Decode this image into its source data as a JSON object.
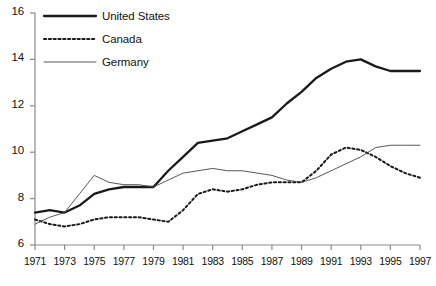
{
  "chart_data": {
    "type": "line",
    "title": "",
    "xlabel": "",
    "ylabel": "",
    "xlim": [
      1971,
      1997
    ],
    "ylim": [
      6,
      16
    ],
    "yticks": [
      6,
      8,
      10,
      12,
      14,
      16
    ],
    "ytick_labels": [
      "6",
      "8",
      "10",
      "12",
      "14",
      "16"
    ],
    "xticks": [
      1971,
      1973,
      1975,
      1977,
      1979,
      1981,
      1983,
      1985,
      1987,
      1989,
      1991,
      1993,
      1995,
      1997
    ],
    "xtick_labels": [
      "1971",
      "1973",
      "1975",
      "1977",
      "1979",
      "1981",
      "1983",
      "1985",
      "1987",
      "1989",
      "1991",
      "1993",
      "1995",
      "1997"
    ],
    "grid": false,
    "legend_position": "top-left",
    "x": [
      1971,
      1972,
      1973,
      1974,
      1975,
      1976,
      1977,
      1978,
      1979,
      1980,
      1981,
      1982,
      1983,
      1984,
      1985,
      1986,
      1987,
      1988,
      1989,
      1990,
      1991,
      1992,
      1993,
      1994,
      1995,
      1996,
      1997
    ],
    "series": [
      {
        "name": "United States",
        "style": "thick-solid",
        "color": "#1a1a1a",
        "values": [
          7.4,
          7.5,
          7.4,
          7.7,
          8.2,
          8.4,
          8.5,
          8.5,
          8.5,
          9.2,
          9.8,
          10.4,
          10.5,
          10.6,
          10.9,
          11.2,
          11.5,
          12.1,
          12.6,
          13.2,
          13.6,
          13.9,
          14.0,
          13.7,
          13.5,
          13.5,
          13.5
        ]
      },
      {
        "name": "Canada",
        "style": "dotted",
        "color": "#1a1a1a",
        "values": [
          7.1,
          6.9,
          6.8,
          6.9,
          7.1,
          7.2,
          7.2,
          7.2,
          7.1,
          7.0,
          7.5,
          8.2,
          8.4,
          8.3,
          8.4,
          8.6,
          8.7,
          8.7,
          8.7,
          9.2,
          9.9,
          10.2,
          10.1,
          9.8,
          9.4,
          9.1,
          8.9
        ]
      },
      {
        "name": "Germany",
        "style": "thin-solid",
        "color": "#444444",
        "values": [
          6.9,
          7.2,
          7.4,
          8.2,
          9.0,
          8.7,
          8.6,
          8.6,
          8.5,
          8.8,
          9.1,
          9.2,
          9.3,
          9.2,
          9.2,
          9.1,
          9.0,
          8.8,
          8.7,
          8.9,
          9.2,
          9.5,
          9.8,
          10.2,
          10.3,
          10.3,
          10.3
        ]
      }
    ],
    "legend": [
      {
        "label": "United States",
        "style": "thick-solid"
      },
      {
        "label": "Canada",
        "style": "dotted"
      },
      {
        "label": "Germany",
        "style": "thin-solid"
      }
    ],
    "colors": {
      "axis": "#8a8a8a",
      "text": "#111111",
      "us": "#1a1a1a",
      "canada": "#1a1a1a",
      "germany": "#4a4a4a",
      "background": "#ffffff"
    }
  }
}
